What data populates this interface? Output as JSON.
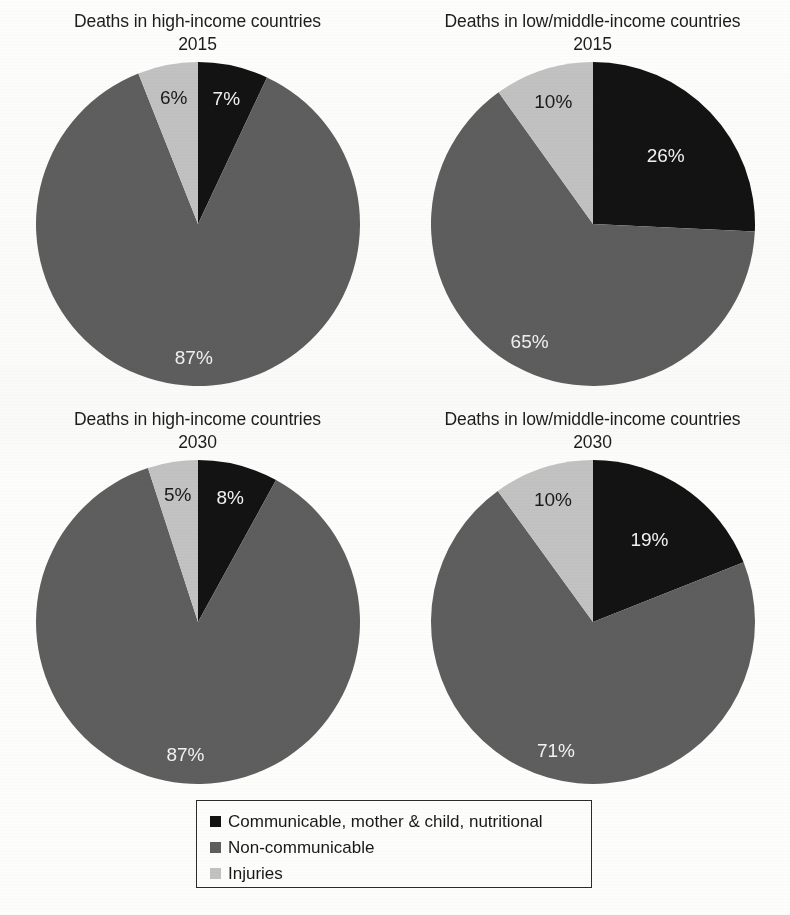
{
  "figure": {
    "background": "#fdfdfb",
    "palette": {
      "communicable": "#131313",
      "non_communicable": "#5e5e5e",
      "injuries": "#c2c2c2",
      "label_dark": "#1a1a1a",
      "label_light": "#f2f2f2",
      "legend_border": "#2b2b2b"
    }
  },
  "legend": {
    "items": [
      {
        "label": "Communicable, mother & child, nutritional",
        "color": "#131313",
        "swatch": "black-square-swatch"
      },
      {
        "label": "Non-communicable",
        "color": "#5e5e5e",
        "swatch": "gray-square-swatch"
      },
      {
        "label": "Injuries",
        "color": "#c2c2c2",
        "swatch": "light-gray-square-swatch"
      }
    ]
  },
  "charts": [
    {
      "id": "high-income-2015",
      "title": "Deaths in high-income countries",
      "year": "2015",
      "labels": {
        "communicable": "7%",
        "non_communicable": "87%",
        "injuries": "6%"
      }
    },
    {
      "id": "low-middle-income-2015",
      "title": "Deaths in low/middle-income countries",
      "year": "2015",
      "labels": {
        "communicable": "26%",
        "non_communicable": "65%",
        "injuries": "10%"
      }
    },
    {
      "id": "high-income-2030",
      "title": "Deaths in high-income countries",
      "year": "2030",
      "labels": {
        "communicable": "8%",
        "non_communicable": "87%",
        "injuries": "5%"
      }
    },
    {
      "id": "low-middle-income-2030",
      "title": "Deaths in low/middle-income countries",
      "year": "2030",
      "labels": {
        "communicable": "19%",
        "non_communicable": "71%",
        "injuries": "10%"
      }
    }
  ],
  "chart_data": [
    {
      "type": "pie",
      "title": "Deaths in high-income countries 2015",
      "categories": [
        "Communicable, mother & child, nutritional",
        "Non-communicable",
        "Injuries"
      ],
      "values": [
        7,
        87,
        6
      ],
      "unit": "%",
      "colors": [
        "#131313",
        "#5e5e5e",
        "#c2c2c2"
      ],
      "start_angle_deg": 0,
      "direction": "clockwise",
      "legend": "shared, below figure"
    },
    {
      "type": "pie",
      "title": "Deaths in low/middle-income countries 2015",
      "categories": [
        "Communicable, mother & child, nutritional",
        "Non-communicable",
        "Injuries"
      ],
      "values": [
        26,
        65,
        10
      ],
      "unit": "%",
      "colors": [
        "#131313",
        "#5e5e5e",
        "#c2c2c2"
      ],
      "start_angle_deg": 0,
      "direction": "clockwise",
      "legend": "shared, below figure"
    },
    {
      "type": "pie",
      "title": "Deaths in high-income countries 2030",
      "categories": [
        "Communicable, mother & child, nutritional",
        "Non-communicable",
        "Injuries"
      ],
      "values": [
        8,
        87,
        5
      ],
      "unit": "%",
      "colors": [
        "#131313",
        "#5e5e5e",
        "#c2c2c2"
      ],
      "start_angle_deg": 0,
      "direction": "clockwise",
      "legend": "shared, below figure"
    },
    {
      "type": "pie",
      "title": "Deaths in low/middle-income countries 2030",
      "categories": [
        "Communicable, mother & child, nutritional",
        "Non-communicable",
        "Injuries"
      ],
      "values": [
        19,
        71,
        10
      ],
      "unit": "%",
      "colors": [
        "#131313",
        "#5e5e5e",
        "#c2c2c2"
      ],
      "start_angle_deg": 0,
      "direction": "clockwise",
      "legend": "shared, below figure"
    }
  ]
}
